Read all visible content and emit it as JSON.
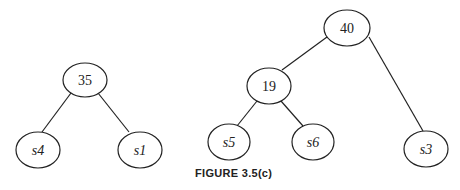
{
  "figure": {
    "caption": "FIGURE 3.5(c)"
  },
  "trees": [
    {
      "root": {
        "label": "35"
      },
      "children": [
        {
          "label": "s4"
        },
        {
          "label": "s1"
        }
      ]
    },
    {
      "root": {
        "label": "40"
      },
      "children": [
        {
          "label": "19",
          "children": [
            {
              "label": "s5"
            },
            {
              "label": "s6"
            }
          ]
        },
        {
          "label": "s3"
        }
      ]
    }
  ],
  "nodes": {
    "n35": "35",
    "s4": "s4",
    "s1": "s1",
    "n40": "40",
    "n19": "19",
    "s5": "s5",
    "s6": "s6",
    "s3": "s3"
  },
  "colors": {
    "stroke": "#222222",
    "background": "#ffffff"
  }
}
